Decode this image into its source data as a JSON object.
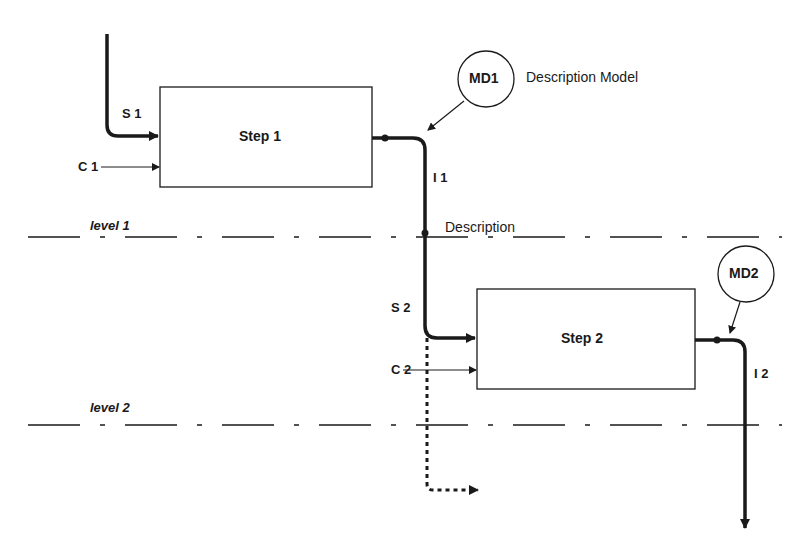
{
  "diagram": {
    "steps": [
      {
        "id": "step1",
        "label": "Step 1"
      },
      {
        "id": "step2",
        "label": "Step 2"
      }
    ],
    "inputs": {
      "s1": "S 1",
      "c1": "C 1",
      "s2": "S 2",
      "c2": "C 2"
    },
    "outputs": {
      "i1": "I 1",
      "i2": "I 2"
    },
    "models": [
      {
        "id": "md1",
        "label": "MD1",
        "caption": "Description Model"
      },
      {
        "id": "md2",
        "label": "MD2"
      }
    ],
    "levels": [
      {
        "label": "level 1",
        "caption": "Description"
      },
      {
        "label": "level 2"
      }
    ],
    "colors": {
      "ink": "#1a1a1a",
      "background": "#ffffff"
    }
  }
}
